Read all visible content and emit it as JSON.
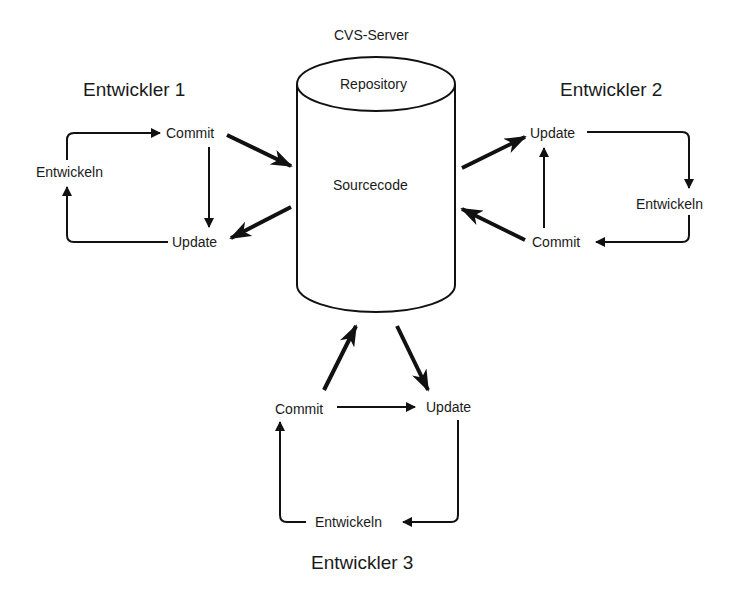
{
  "server": {
    "title": "CVS-Server",
    "top_label": "Repository",
    "body_label": "Sourcecode"
  },
  "developers": [
    {
      "title": "Entwickler 1",
      "commit": "Commit",
      "update": "Update",
      "develop": "Entwickeln"
    },
    {
      "title": "Entwickler 2",
      "commit": "Commit",
      "update": "Update",
      "develop": "Entwickeln"
    },
    {
      "title": "Entwickler 3",
      "commit": "Commit",
      "update": "Update",
      "develop": "Entwickeln"
    }
  ],
  "colors": {
    "stroke": "#111111",
    "background": "#ffffff",
    "text": "#1a1a1a"
  }
}
